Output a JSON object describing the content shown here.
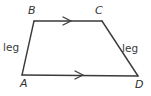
{
  "figure": {
    "kind": "geometry-diagram",
    "shape_name": "trapezoid",
    "canvas": {
      "width": 151,
      "height": 96,
      "background": "#ffffff"
    },
    "stroke_color": "#3a3a3a",
    "text_color": "#2f2f2f",
    "stroke_width": 1.4,
    "vertices": [
      {
        "id": "A",
        "label": "A",
        "x": 22,
        "y": 75
      },
      {
        "id": "B",
        "label": "B",
        "x": 34,
        "y": 21
      },
      {
        "id": "C",
        "label": "C",
        "x": 102,
        "y": 21
      },
      {
        "id": "D",
        "label": "D",
        "x": 138,
        "y": 76
      }
    ],
    "edges": [
      {
        "id": "AB",
        "from": "A",
        "to": "B",
        "label": "leg",
        "ticks": 0
      },
      {
        "id": "BC",
        "from": "B",
        "to": "C",
        "label": "",
        "ticks": 1
      },
      {
        "id": "CD",
        "from": "C",
        "to": "D",
        "label": "leg",
        "ticks": 0
      },
      {
        "id": "AD",
        "from": "A",
        "to": "D",
        "label": "",
        "ticks": 1
      }
    ],
    "side_labels": {
      "left_leg": "leg",
      "right_leg": "leg"
    },
    "arrow_marks": [
      {
        "on_edge": "BC",
        "x": 67,
        "y": 21,
        "direction": "right",
        "glyph": "chevron-right"
      },
      {
        "on_edge": "AD",
        "x": 79,
        "y": 75,
        "direction": "right",
        "glyph": "chevron-right"
      }
    ]
  }
}
